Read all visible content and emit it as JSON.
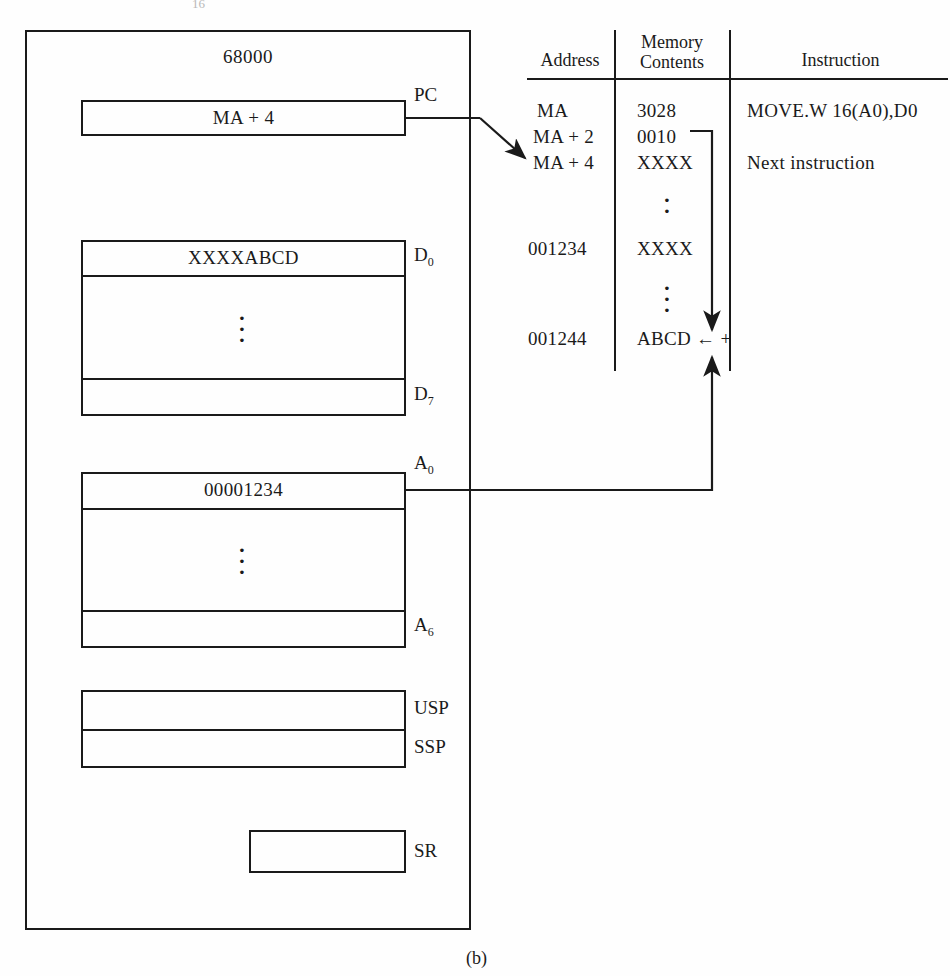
{
  "figure": {
    "caption": "(b)",
    "top_partial_mark": "16"
  },
  "cpu": {
    "title": "68000",
    "registers": {
      "pc": {
        "label": "PC",
        "value": "MA + 4"
      },
      "data_registers": {
        "first_label": "D0",
        "first_label_base": "D",
        "first_label_sub": "0",
        "first_value": "XXXXABCD",
        "last_label_base": "D",
        "last_label_sub": "7",
        "last_value": ""
      },
      "address_registers": {
        "first_label_base": "A",
        "first_label_sub": "0",
        "first_value": "00001234",
        "last_label_base": "A",
        "last_label_sub": "6",
        "last_value": ""
      },
      "usp": {
        "label": "USP",
        "value": ""
      },
      "ssp": {
        "label": "SSP",
        "value": ""
      },
      "sr": {
        "label": "SR",
        "value": ""
      }
    }
  },
  "memory_table": {
    "headers": {
      "address": "Address",
      "memory_contents_line1": "Memory",
      "memory_contents_line2": "Contents",
      "instruction": "Instruction"
    },
    "rows": [
      {
        "address": "MA",
        "contents": "3028",
        "instruction": "MOVE.W 16(A0),D0"
      },
      {
        "address": "MA + 2",
        "contents": "0010",
        "instruction": ""
      },
      {
        "address": "MA + 4",
        "contents": "XXXX",
        "instruction": "Next instruction"
      },
      {
        "address": "",
        "contents": "⋮",
        "instruction": ""
      },
      {
        "address": "001234",
        "contents": "XXXX",
        "instruction": ""
      },
      {
        "address": "",
        "contents": "⋮",
        "instruction": ""
      },
      {
        "address": "001244",
        "contents": "ABCD ← +",
        "instruction": ""
      }
    ]
  },
  "annotations": {
    "pc_to_memory_arrow": "PC points to MA + 4",
    "displacement_arrow": "0010 displacement added",
    "base_address_arrow": "A0 base address added"
  },
  "colors": {
    "ink": "#1a1a1a",
    "paper": "#fefefe"
  }
}
